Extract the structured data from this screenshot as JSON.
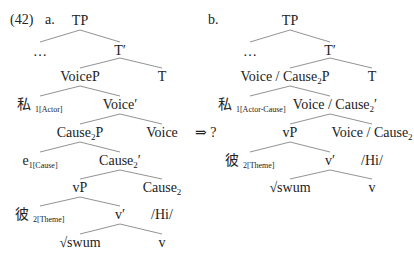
{
  "example_number": "(42)",
  "tree_a": {
    "label": "a.",
    "TP": "TP",
    "ellipsis": "…",
    "Tbar": "T′",
    "VoiceP": "VoiceP",
    "T": "T",
    "subj": "私",
    "subj_index": "1[Actor]",
    "Voicebar": "Voice′",
    "CauseP_base": "Cause",
    "CauseP_sub": "2",
    "CauseP_tail": "P",
    "Voice": "Voice",
    "e": "e",
    "e_index": "1[Cause]",
    "Causebar_base": "Cause",
    "Causebar_sub": "2",
    "Causebar_tail": "′",
    "vP": "vP",
    "Cause_base": "Cause",
    "Cause_sub": "2",
    "obj": "彼",
    "obj_index": "2[Theme]",
    "vbar": "v′",
    "morph": "/Hi/",
    "root": "√swum",
    "v": "v"
  },
  "arrow": "⇒ ?",
  "tree_b": {
    "label": "b.",
    "TP": "TP",
    "ellipsis": "…",
    "Tbar": "T′",
    "VCP_base": "Voice / Cause",
    "VCP_sub": "2",
    "VCP_tail": "P",
    "T": "T",
    "subj": "私",
    "subj_index": "1[Actor-Cause]",
    "VCbar_base": "Voice / Cause",
    "VCbar_sub": "2",
    "VCbar_tail": "′",
    "vP": "vP",
    "VC_base": "Voice / Cause",
    "VC_sub": "2",
    "obj": "彼",
    "obj_index": "2[Theme]",
    "vbar": "v′",
    "morph": "/Hi/",
    "root": "√swum",
    "v": "v"
  }
}
